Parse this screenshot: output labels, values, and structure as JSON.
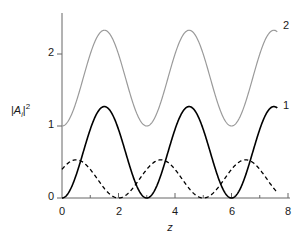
{
  "chart_data": {
    "type": "line",
    "title": "",
    "subtitle": "",
    "xlabel": "z",
    "ylabel": "|A_i|^2",
    "ylabel_parts": {
      "bar1": "|",
      "A": "A",
      "sub": "i",
      "bar2": "|",
      "sup": "2"
    },
    "xlim": [
      0,
      8
    ],
    "ylim": [
      0,
      2.55
    ],
    "x_major_ticks": [
      0,
      2,
      4,
      6,
      8
    ],
    "x_minor_ticks": [
      1,
      3,
      5,
      7
    ],
    "x_tick_labels": [
      "0",
      "2",
      "4",
      "6",
      "8"
    ],
    "y_major_ticks": [
      0,
      1,
      2
    ],
    "y_tick_labels": [
      "0",
      "1",
      "2"
    ],
    "grid": false,
    "legend_position": "inline-right-end",
    "series": [
      {
        "name": "2",
        "label": "2",
        "color": "#9a9a9a",
        "style": "solid",
        "width": 1.2,
        "description": "Pump intensity, oscillates between 1.0 and 2.33 with period 3",
        "x_start": 0.0,
        "x_end": 7.62,
        "baseline": 1.0,
        "amplitude": 1.33,
        "period": 3.0,
        "phase_min_at": 0.0,
        "min": 1.0,
        "max": 2.33,
        "minima_at": [
          0,
          3,
          6
        ],
        "maxima_at": [
          1.5,
          4.5,
          7.5
        ],
        "end_value": 2.28
      },
      {
        "name": "1",
        "label": "1",
        "color": "#000000",
        "style": "solid",
        "width": 1.6,
        "description": "Signal intensity, oscillates between 0 and 1.27 with period 3",
        "x_start": 0.0,
        "x_end": 7.62,
        "baseline": 0.0,
        "amplitude": 1.27,
        "period": 3.0,
        "phase_min_at": 0.0,
        "min": 0.0,
        "max": 1.27,
        "minima_at": [
          0,
          3,
          6
        ],
        "maxima_at": [
          1.5,
          4.5,
          7.5
        ],
        "end_value": 1.21
      },
      {
        "name": "dashed",
        "label": "",
        "color": "#000000",
        "style": "dashed",
        "dash": "4,3",
        "width": 1.3,
        "description": "Idler intensity, oscillates between 0 and 0.53 with period 3, offset by half period",
        "x_start": 0.0,
        "x_end": 7.62,
        "baseline": 0.0,
        "amplitude": 0.53,
        "period": 3.0,
        "phase_min_at": 2.0,
        "min": 0.0,
        "max": 0.53,
        "minima_at": [
          2,
          3.5,
          5,
          6.5
        ],
        "maxima_at": [
          1,
          2.75,
          4.25,
          5.75,
          7.0
        ],
        "end_value": 0.17
      }
    ],
    "annotations": [
      {
        "text": "2",
        "x": 7.85,
        "y": 2.3,
        "series": "2"
      },
      {
        "text": "1",
        "x": 7.85,
        "y": 1.25,
        "series": "1"
      }
    ]
  },
  "axes": {
    "y_ticks": [
      {
        "value": 2,
        "label": "2"
      },
      {
        "value": 1,
        "label": "1"
      },
      {
        "value": 0,
        "label": "0"
      }
    ],
    "x_ticks": [
      {
        "value": 0,
        "label": "0"
      },
      {
        "value": 2,
        "label": "2"
      },
      {
        "value": 4,
        "label": "4"
      },
      {
        "value": 6,
        "label": "6"
      },
      {
        "value": 8,
        "label": "8"
      }
    ],
    "x_axis_title": "z",
    "y_axis_title_A": "A",
    "y_axis_title_sub": "i",
    "y_axis_title_sup": "2",
    "y_axis_title_bar": "|"
  },
  "colors": {
    "axis": "#666666",
    "series_1": "#000000",
    "series_2": "#9a9a9a",
    "text": "#1a1a1a",
    "background": "#ffffff"
  }
}
